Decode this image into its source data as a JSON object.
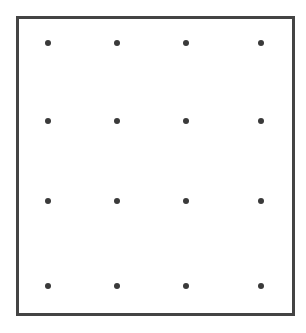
{
  "diagram": {
    "type": "dot-grid",
    "rows": 4,
    "columns": 4,
    "frame": {
      "border_color": "#444444",
      "background": "#ffffff"
    },
    "dot_color": "#3a3a3a",
    "column_x": [
      48,
      117,
      186,
      261
    ],
    "row_y": [
      43,
      121,
      201,
      286
    ]
  }
}
